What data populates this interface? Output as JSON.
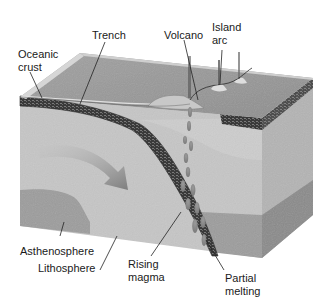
{
  "diagram": {
    "labels": {
      "oceanic_crust": "Oceanic\ncrust",
      "trench": "Trench",
      "volcano": "Volcano",
      "island_arc": "Island\narc",
      "asthenosphere": "Asthenosphere",
      "lithosphere": "Lithosphere",
      "rising_magma": "Rising\nmagma",
      "partial_melting": "Partial\nmelting"
    },
    "colors": {
      "background": "#ffffff",
      "ocean_surface": "#9a9a9a",
      "ocean_rim": "#d2d2d2",
      "lithosphere": "#c6c6c6",
      "lithosphere_side": "#b4b4b4",
      "asthenosphere": "#9c9c9c",
      "asthenosphere_side": "#8a8a8a",
      "crust_band": "#3a3a3a",
      "arrow": "#8c8c8c",
      "label_text": "#1a1a1a",
      "leader_line": "#222222"
    }
  }
}
